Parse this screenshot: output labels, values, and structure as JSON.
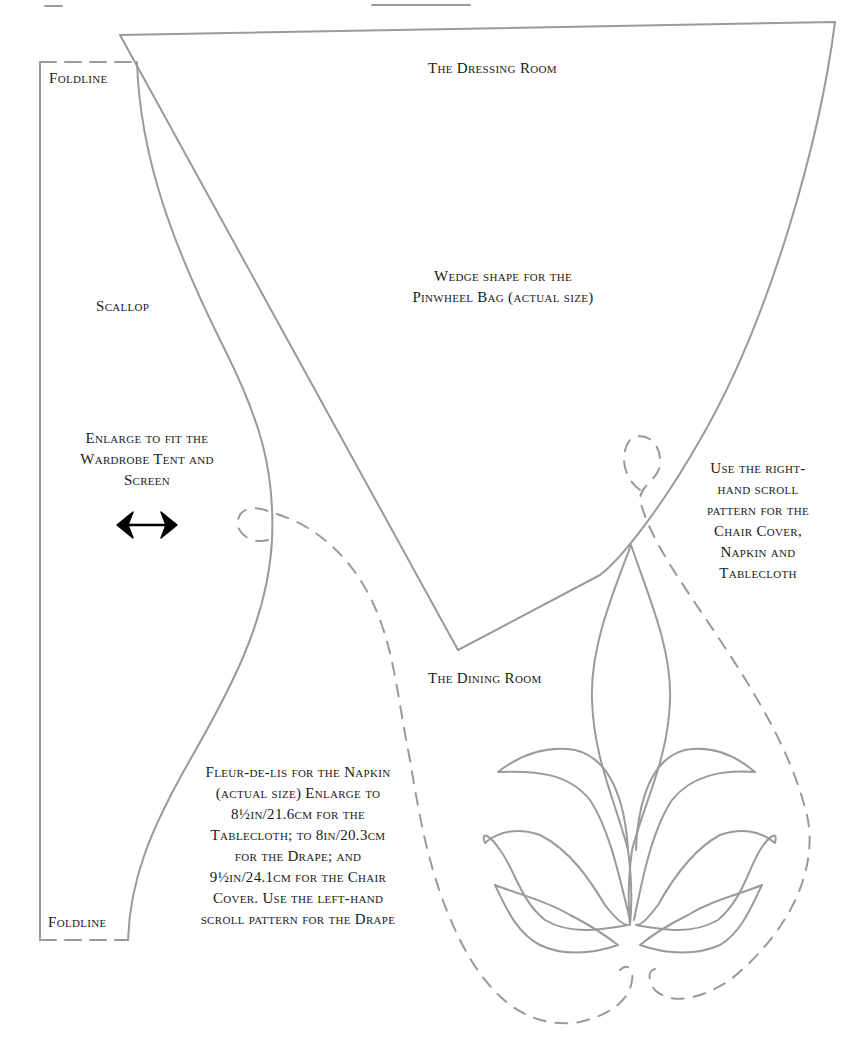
{
  "page": {
    "colors": {
      "line": "#9a9a9a",
      "text": "#1a1a1a",
      "background": "#ffffff"
    }
  },
  "sections": {
    "dressing_room": {
      "heading": "The Dressing Room",
      "wedge_label": [
        "Wedge shape for the",
        "Pinwheel Bag (actual size)"
      ],
      "scallop_label": "Scallop",
      "enlarge_label": [
        "Enlarge to fit the",
        "Wardrobe Tent and",
        "Screen"
      ],
      "foldline_top": "Foldline",
      "foldline_bottom": "Foldline",
      "arrow_icon": "double-arrow-horizontal"
    },
    "dining_room": {
      "heading": "The Dining Room",
      "right_note": [
        "Use the right-",
        "hand scroll",
        "pattern for the",
        "Chair Cover,",
        "Napkin and",
        "Tablecloth"
      ],
      "fleur_note": [
        "Fleur-de-lis for the Napkin",
        "(actual size) Enlarge to",
        "8½in/21.6cm for the",
        "Tablecloth; to 8in/20.3cm",
        "for the Drape; and",
        "9½in/24.1cm for the Chair",
        "Cover. Use the left-hand",
        "scroll pattern for the Drape"
      ]
    }
  }
}
